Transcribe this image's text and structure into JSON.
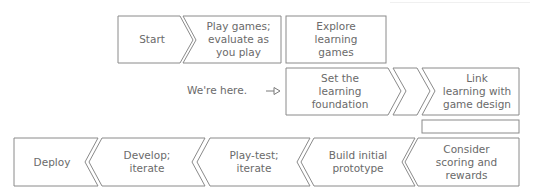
{
  "diagram": {
    "top_row": [
      {
        "id": "start",
        "label": "Start"
      },
      {
        "id": "play-games",
        "label": "Play games;\nevaluate as\nyou play"
      },
      {
        "id": "explore",
        "label": "Explore\nlearning\ngames"
      }
    ],
    "middle_row": [
      {
        "id": "set-foundation",
        "label": "Set the\nlearning\nfoundation"
      },
      {
        "id": "link-learning",
        "label": "Link\nlearning with\ngame design"
      }
    ],
    "bottom_row": [
      {
        "id": "deploy",
        "label": "Deploy"
      },
      {
        "id": "develop",
        "label": "Develop;\niterate"
      },
      {
        "id": "play-test",
        "label": "Play-test;\niterate"
      },
      {
        "id": "build-prototype",
        "label": "Build initial\nprototype"
      },
      {
        "id": "consider-scoring",
        "label": "Consider\nscoring and\nrewards"
      }
    ],
    "marker": {
      "text": "We're here.",
      "arrow": "hollow-arrow-right"
    }
  }
}
